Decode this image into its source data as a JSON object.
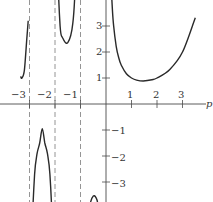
{
  "chart_data": {
    "type": "line",
    "title": "",
    "function": "Gamma function Γ(p)",
    "xlabel": "p",
    "ylabel": "",
    "xlim": [
      -4.1,
      4.1
    ],
    "ylim": [
      -3.8,
      4.0
    ],
    "grid": false,
    "legend": null,
    "x_ticks": [
      -3,
      -2,
      -1,
      1,
      2,
      3
    ],
    "x_tick_labels": [
      "−3",
      "−2",
      "−1",
      "1",
      "2",
      "3"
    ],
    "y_ticks": [
      3,
      2,
      1,
      -1,
      -2,
      -3
    ],
    "y_tick_labels": [
      "3",
      "2",
      "1",
      "−1",
      "−2",
      "−3"
    ],
    "asymptotes_x": [
      -3,
      -2,
      -1,
      0
    ],
    "series": [
      {
        "name": "branch p>0",
        "x": [
          0.2,
          0.25,
          0.3,
          0.4,
          0.5,
          0.6,
          0.8,
          1.0,
          1.2,
          1.46,
          1.8,
          2.0,
          2.5,
          3.0,
          3.5
        ],
        "y": [
          4.59,
          3.63,
          2.99,
          2.22,
          1.77,
          1.49,
          1.16,
          1.0,
          0.92,
          0.886,
          0.93,
          1.0,
          1.33,
          2.0,
          3.32
        ]
      },
      {
        "name": "branch -1<p<0",
        "x": [
          -0.28,
          -0.35,
          -0.5,
          -0.65,
          -0.75,
          -0.85,
          -0.92
        ],
        "y": [
          -4.3,
          -3.7,
          -3.54,
          -3.97,
          -4.83,
          -7.8,
          -14
        ]
      },
      {
        "name": "branch -2<p<-1",
        "x": [
          -1.06,
          -1.1,
          -1.2,
          -1.3,
          -1.5,
          -1.7,
          -1.8,
          -1.9,
          -1.94
        ],
        "y": [
          16.5,
          9.7,
          4.85,
          3.1,
          2.36,
          2.55,
          3.0,
          5.5,
          8.9
        ]
      },
      {
        "name": "branch -3<p<-2",
        "x": [
          -2.06,
          -2.1,
          -2.2,
          -2.3,
          -2.4,
          -2.5,
          -2.6,
          -2.7,
          -2.8,
          -2.9,
          -2.94
        ],
        "y": [
          -8.2,
          -5.0,
          -2.7,
          -1.9,
          -1.5,
          -0.945,
          -1.5,
          -1.9,
          -2.7,
          -5.0,
          -8.2
        ]
      },
      {
        "name": "branch -4<p<-3",
        "x": [
          -3.35,
          -3.3,
          -3.2,
          -3.1,
          -3.05
        ],
        "y": [
          1.06,
          1.0,
          1.3,
          2.6,
          3.2
        ]
      }
    ]
  },
  "labels": {
    "x_axis": "p",
    "x_ticks": [
      "−3",
      "−2",
      "−1",
      "1",
      "2",
      "3"
    ],
    "y_ticks_pos": [
      "3",
      "2",
      "1"
    ],
    "y_ticks_neg": [
      "−1",
      "−2",
      "−3"
    ]
  }
}
